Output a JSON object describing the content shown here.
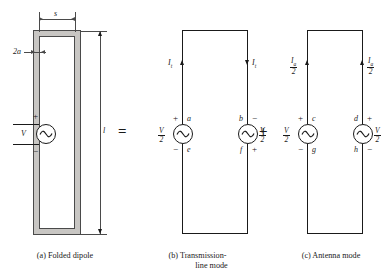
{
  "figure": {
    "operators": {
      "equals": "=",
      "plus": "+"
    },
    "panels": [
      {
        "id": "a",
        "caption_line1": "(a)  Folded dipole",
        "caption_line2": "",
        "dimensions": [
          {
            "name": "spacing",
            "label": "s"
          },
          {
            "name": "conductor-diameter",
            "label": "2a"
          },
          {
            "name": "length",
            "label": "l"
          }
        ],
        "source": {
          "label": "V",
          "plus": "+",
          "minus": "−"
        }
      },
      {
        "id": "b",
        "caption_line1": "(b)  Transmission-",
        "caption_line2": "line mode",
        "currents": [
          {
            "name": "left-current",
            "sym": "I",
            "sub": "t",
            "direction": "up"
          },
          {
            "name": "right-current",
            "sym": "I",
            "sub": "t",
            "direction": "down"
          }
        ],
        "sources": [
          {
            "name": "left-source",
            "voltage_num": "V",
            "voltage_den": "2",
            "top_polarity": "+",
            "bottom_polarity": "−",
            "top_node": "a",
            "bottom_node": "e"
          },
          {
            "name": "right-source",
            "voltage_num": "V",
            "voltage_den": "2",
            "top_polarity": "−",
            "bottom_polarity": "+",
            "top_node": "b",
            "bottom_node": "f"
          }
        ]
      },
      {
        "id": "c",
        "caption_line1": "(c)  Antenna mode",
        "caption_line2": "",
        "currents": [
          {
            "name": "left-current",
            "sym": "I",
            "sub": "a",
            "den": "2",
            "direction": "up"
          },
          {
            "name": "right-current",
            "sym": "I",
            "sub": "a",
            "den": "2",
            "direction": "up"
          }
        ],
        "sources": [
          {
            "name": "left-source",
            "voltage_num": "V",
            "voltage_den": "2",
            "top_polarity": "+",
            "bottom_polarity": "−",
            "top_node": "c",
            "bottom_node": "g"
          },
          {
            "name": "right-source",
            "voltage_num": "V",
            "voltage_den": "2",
            "top_polarity": "+",
            "bottom_polarity": "−",
            "top_node": "d",
            "bottom_node": "h"
          }
        ]
      }
    ],
    "colors": {
      "line": "#1a1a1a",
      "dim_line": "#4a4a4a",
      "conductor_fill": "#c8c6c3",
      "background": "#ffffff"
    }
  }
}
